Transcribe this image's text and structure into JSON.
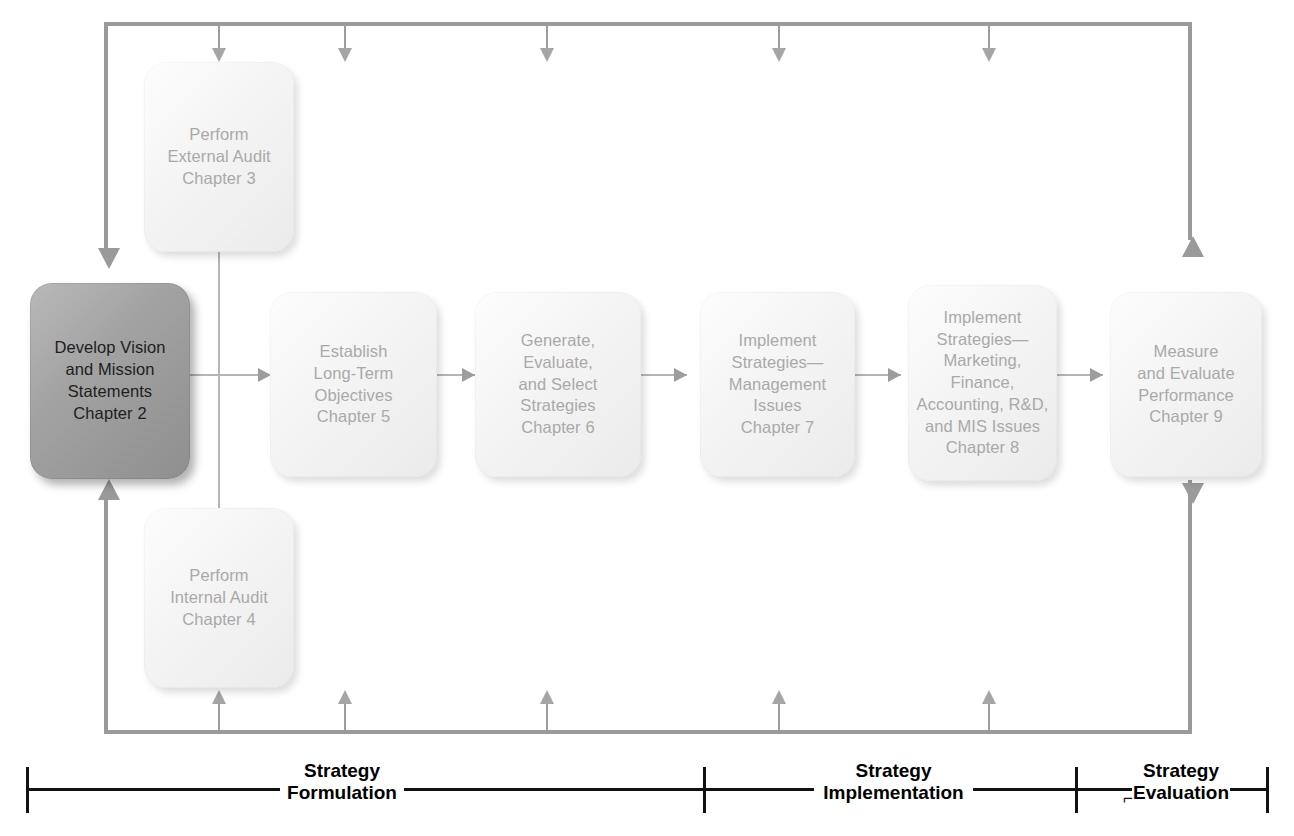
{
  "diagram": {
    "accent_dark": "#9a9a9a",
    "line_color": "#9d9d9d",
    "primary_box_color": "#a2a2a2",
    "box_color": "#f2f2f2",
    "legend_color": "#111111"
  },
  "nodes": {
    "vision_mission": "Develop Vision\nand Mission\nStatements\nChapter 2",
    "external_audit": "Perform\nExternal Audit\nChapter 3",
    "internal_audit": "Perform\nInternal Audit\nChapter 4",
    "objectives": "Establish\nLong-Term\nObjectives\nChapter 5",
    "select_strategies": "Generate,\nEvaluate,\nand Select\nStrategies\nChapter 6",
    "implement_management": "Implement\nStrategies—\nManagement\nIssues\nChapter 7",
    "implement_functional": "Implement\nStrategies—\nMarketing,\nFinance,\nAccounting, R&D,\nand MIS Issues\nChapter 8",
    "measure_evaluate": "Measure\nand Evaluate\nPerformance\nChapter 9"
  },
  "legend": {
    "formulation": "Strategy\nFormulation",
    "implementation": "Strategy\nImplementation",
    "evaluation": "Strategy\nEvaluation",
    "evaluation_mark": "⌐"
  }
}
